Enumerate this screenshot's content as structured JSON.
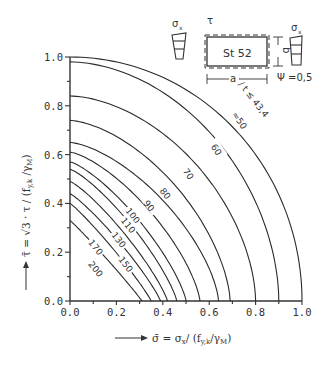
{
  "chart_data": {
    "type": "line",
    "title": "",
    "xlabel": "σ̄ = σx / (fy,k / γM)",
    "ylabel": "τ̄ = √3 · τ / (fy,k / γM)",
    "xlim": [
      0.0,
      1.0
    ],
    "ylim": [
      0.0,
      1.0
    ],
    "x_ticks": [
      "0.0",
      "0.2",
      "0.4",
      "0.6",
      "0.8",
      "1.0"
    ],
    "y_ticks": [
      "0.0",
      "0.2",
      "0.4",
      "0.6",
      "0.8",
      "1.0"
    ],
    "grid": false,
    "legend": null,
    "series": [
      {
        "name": "b/t ≤ 43,4",
        "x_intercept": 1.0,
        "y_intercept": 1.0,
        "shape": 2.0,
        "label": "b / t ≤ 43,4",
        "label_pos": [
          0.78,
          0.84
        ],
        "label_rot": 52
      },
      {
        "name": "50",
        "x_intercept": 0.9,
        "y_intercept": 0.98,
        "shape": 1.85,
        "label": "≈50",
        "label_pos": [
          0.73,
          0.74
        ],
        "label_rot": 55
      },
      {
        "name": "60",
        "x_intercept": 0.8,
        "y_intercept": 0.84,
        "shape": 1.75,
        "label": "60",
        "label_pos": [
          0.63,
          0.62
        ],
        "label_rot": 55
      },
      {
        "name": "70",
        "x_intercept": 0.69,
        "y_intercept": 0.74,
        "shape": 1.6,
        "label": "70",
        "label_pos": [
          0.51,
          0.52
        ],
        "label_rot": 55
      },
      {
        "name": "80",
        "x_intercept": 0.64,
        "y_intercept": 0.65,
        "shape": 1.5,
        "label": "80",
        "label_pos": [
          0.41,
          0.44
        ],
        "label_rot": 52
      },
      {
        "name": "90",
        "x_intercept": 0.56,
        "y_intercept": 0.61,
        "shape": 1.4,
        "label": "90",
        "label_pos": [
          0.34,
          0.39
        ],
        "label_rot": 52
      },
      {
        "name": "100",
        "x_intercept": 0.5,
        "y_intercept": 0.57,
        "shape": 1.3,
        "label": "100",
        "label_pos": [
          0.27,
          0.35
        ],
        "label_rot": 52
      },
      {
        "name": "110",
        "x_intercept": 0.46,
        "y_intercept": 0.54,
        "shape": 1.25,
        "label": "110",
        "label_pos": [
          0.25,
          0.31
        ],
        "label_rot": 52
      },
      {
        "name": "130",
        "x_intercept": 0.42,
        "y_intercept": 0.49,
        "shape": 1.2,
        "label": "130",
        "label_pos": [
          0.21,
          0.25
        ],
        "label_rot": 52
      },
      {
        "name": "150",
        "x_intercept": 0.39,
        "y_intercept": 0.44,
        "shape": 1.15,
        "label": "150",
        "label_pos": [
          0.24,
          0.15
        ],
        "label_rot": 52
      },
      {
        "name": "170",
        "x_intercept": 0.35,
        "y_intercept": 0.4,
        "shape": 1.1,
        "label": "170",
        "label_pos": [
          0.11,
          0.22
        ],
        "label_rot": 52
      },
      {
        "name": "200",
        "x_intercept": 0.31,
        "y_intercept": 0.33,
        "shape": 1.05,
        "label": "200",
        "label_pos": [
          0.11,
          0.13
        ],
        "label_rot": 52
      }
    ],
    "annotations": [
      "σx",
      "τ",
      "St 52",
      "a",
      "b",
      "σx",
      "Ψ = 0,5"
    ]
  },
  "inset": {
    "sigma_left": "σ",
    "sigma_left_sub": "x",
    "tau": "τ",
    "material": "St 52",
    "dim_a": "a",
    "dim_b": "b",
    "sigma_right": "σ",
    "sigma_right_sub": "x",
    "psi": "Ψ =0,5"
  },
  "labels": {
    "x_axis": "σ̄ = σ",
    "x_axis_tail": "/ (f",
    "x_axis_sub1": "x",
    "x_axis_sub2": "y,k",
    "x_axis_end": "/γ",
    "x_axis_sub3": "M",
    "x_axis_close": ")",
    "y_axis": "τ̄ = √3 · τ / (f",
    "y_axis_sub1": "y,k",
    "y_axis_mid": " /γ",
    "y_axis_sub2": "M",
    "y_axis_close": ")"
  }
}
